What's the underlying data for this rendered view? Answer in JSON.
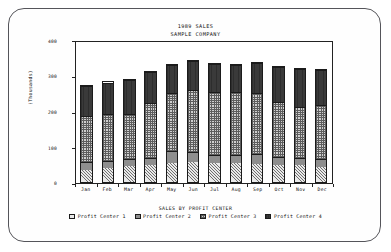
{
  "chart_data": {
    "type": "bar",
    "stacked": true,
    "title": "1989 SALES",
    "subtitle": "SAMPLE COMPANY",
    "legend_title": "SALES BY PROFIT CENTER",
    "legend_position": "bottom",
    "grid": false,
    "xlabel": "",
    "ylabel": "(Thousands)",
    "ylim": [
      0,
      400
    ],
    "yticks": [
      0,
      100,
      200,
      300,
      400
    ],
    "ytick_labels": [
      "0",
      "100",
      "200",
      "300",
      "400"
    ],
    "categories": [
      "Jan",
      "Feb",
      "Mar",
      "Apr",
      "May",
      "Jun",
      "Jul",
      "Aug",
      "Sep",
      "Oct",
      "Nov",
      "Dec"
    ],
    "series": [
      {
        "name": "Profit Center 1",
        "pattern": "diagonal-hatch",
        "color": "#e9e9e9",
        "values": [
          35,
          42,
          45,
          48,
          55,
          58,
          55,
          55,
          52,
          50,
          48,
          44
        ]
      },
      {
        "name": "Profit Center 2",
        "pattern": "solid-gray",
        "color": "#8e8e8e",
        "values": [
          22,
          20,
          22,
          22,
          35,
          30,
          22,
          22,
          28,
          22,
          22,
          22
        ]
      },
      {
        "name": "Profit Center 3",
        "pattern": "checkerboard",
        "color": "#cfcfcf",
        "values": [
          133,
          136,
          131,
          158,
          168,
          178,
          182,
          182,
          178,
          160,
          148,
          155
        ]
      },
      {
        "name": "Profit Center 4",
        "pattern": "solid-dark",
        "color": "#3a3a3a",
        "values": [
          88,
          90,
          96,
          90,
          80,
          82,
          82,
          80,
          85,
          100,
          108,
          103
        ]
      }
    ],
    "totals": [
      278,
      288,
      294,
      318,
      338,
      348,
      341,
      339,
      343,
      332,
      326,
      324
    ]
  },
  "frame": {
    "border_color": "#55555a",
    "background": "#fefefe"
  }
}
